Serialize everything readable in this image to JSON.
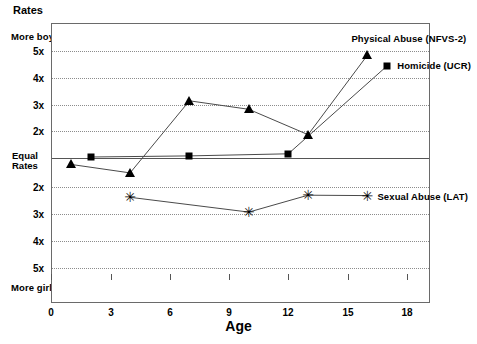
{
  "figure": {
    "y_axis_title": "Rates",
    "x_axis_title": "Age",
    "top_pole_label": "More boys",
    "bottom_pole_label": "More girls",
    "center_label_line1": "Equal",
    "center_label_line2": "Rates"
  },
  "chart_data": {
    "type": "line",
    "title": "Rates",
    "xlabel": "Age",
    "ylabel": "Rates",
    "xlim": [
      0,
      19
    ],
    "xticks": [
      0,
      3,
      6,
      9,
      12,
      15,
      18
    ],
    "xticklabels": [
      "0",
      "3",
      "6",
      "9",
      "12",
      "15",
      "18"
    ],
    "ylim": [
      -5.6,
      5.6
    ],
    "ytick_values": [
      5,
      4,
      3,
      2,
      0,
      -2,
      -3,
      -4,
      -5
    ],
    "ytick_labels": [
      "5x",
      "4x",
      "3x",
      "2x",
      "Equal Rates",
      "2x",
      "3x",
      "4x",
      "5x"
    ],
    "y_positive_meaning": "More boys",
    "y_negative_meaning": "More girls",
    "grid": "horizontal dotted at every labelled ratio; solid line at Equal Rates",
    "legend_position": "inline at right end of each series",
    "series": [
      {
        "name": "Physical Abuse (NFVS-2)",
        "marker": "triangle",
        "points": [
          {
            "x": 1,
            "y": -0.35
          },
          {
            "x": 4,
            "y": -0.75
          },
          {
            "x": 7,
            "y": 2.65
          },
          {
            "x": 10,
            "y": 2.25
          },
          {
            "x": 13,
            "y": 1.05
          },
          {
            "x": 16,
            "y": 4.8
          }
        ]
      },
      {
        "name": "Homicide (UCR)",
        "marker": "square",
        "points": [
          {
            "x": 2,
            "y": 0.0
          },
          {
            "x": 7,
            "y": 0.05
          },
          {
            "x": 12,
            "y": 0.15
          },
          {
            "x": 17,
            "y": 4.3
          }
        ]
      },
      {
        "name": "Sexual Abuse (LAT)",
        "marker": "asterisk",
        "points": [
          {
            "x": 4,
            "y": -1.9
          },
          {
            "x": 10,
            "y": -2.6
          },
          {
            "x": 13,
            "y": -1.8
          },
          {
            "x": 16,
            "y": -1.82
          }
        ]
      }
    ]
  },
  "series_labels": [
    {
      "id": "physical-abuse",
      "text": "Physical Abuse (NFVS-2)"
    },
    {
      "id": "homicide",
      "text": "Homicide (UCR)"
    },
    {
      "id": "sexual-abuse",
      "text": "Sexual Abuse (LAT)"
    }
  ],
  "y_ticks_top": [
    "5x",
    "4x",
    "3x",
    "2x"
  ],
  "y_ticks_bottom": [
    "2x",
    "3x",
    "4x",
    "5x"
  ],
  "x_ticks": [
    "0",
    "3",
    "6",
    "9",
    "12",
    "15",
    "18"
  ]
}
